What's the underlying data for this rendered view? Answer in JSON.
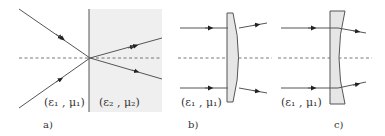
{
  "figure": {
    "panels": [
      {
        "id": "a",
        "caption": "a)",
        "description": "Refraction at a planar interface between two media",
        "medium_left_label": "(ε₁ , μ₁)",
        "medium_right_label": "(ε₂ , μ₂)"
      },
      {
        "id": "b",
        "caption": "b)",
        "description": "Plano-convex lens with parallel incoming rays",
        "medium_label": "(ε₁ , μ₁)"
      },
      {
        "id": "c",
        "caption": "c)",
        "description": "Plano-concave lens with parallel incoming rays",
        "medium_label": "(ε₁ , μ₁)"
      }
    ],
    "colors": {
      "line": "#555555",
      "arrowhead": "#222222",
      "medium_fill": "#efefef",
      "lens_fill": "#e6e6e6",
      "text": "#333333"
    }
  }
}
